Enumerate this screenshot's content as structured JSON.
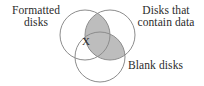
{
  "figure": {
    "type": "venn-diagram-3-set",
    "width": 204,
    "height": 86,
    "background_color": "#ffffff",
    "stroke_color": "#8c8c8c",
    "text_color": "#2b2b2b",
    "shade_color": "#bdbdbd"
  },
  "labels": {
    "formatted": {
      "line1": "Formatted",
      "line2": "disks"
    },
    "contain_data": {
      "line1": "Disks that",
      "line2": "contain data"
    },
    "blank": {
      "line1": "Blank disks"
    },
    "marker": "X"
  },
  "sets": [
    {
      "name": "formatted-disks",
      "cx": 85,
      "cy": 35,
      "r": 25
    },
    {
      "name": "disks-that-contain-data",
      "cx": 110,
      "cy": 35,
      "r": 25
    },
    {
      "name": "blank-disks",
      "cx": 100,
      "cy": 57,
      "r": 25
    }
  ]
}
